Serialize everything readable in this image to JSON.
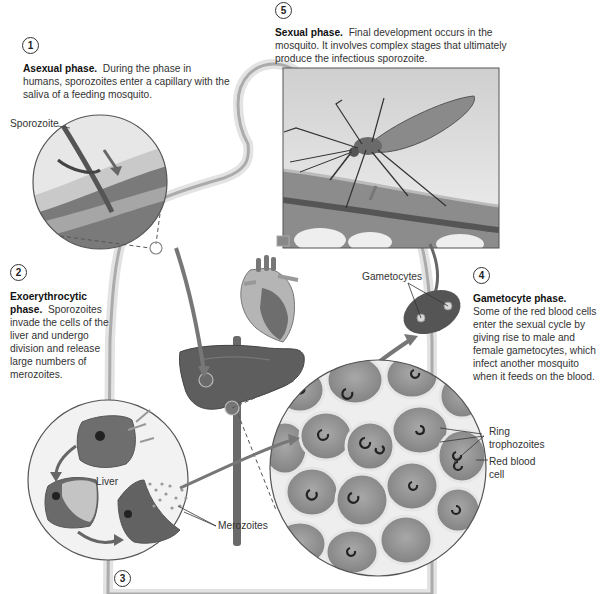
{
  "diagram": {
    "colors": {
      "background": "#ffffff",
      "silhouette_edge": "#6a6a6a",
      "tissue_dark": "#5c5c5c",
      "tissue_mid": "#8a8a8a",
      "cell_fill": "#9a9a9a",
      "cell_border": "#e8e8e8",
      "text": "#333333"
    }
  },
  "steps": [
    {
      "number": "1",
      "title": "Asexual phase.",
      "body": "During the phase in humans, sporozoites enter a capillary with the saliva of a feeding mosquito."
    },
    {
      "number": "2",
      "title": "Exoerythrocytic phase.",
      "body": "Sporozoites invade the cells of the liver and undergo division and release large numbers of merozoites."
    },
    {
      "number": "3",
      "title": "",
      "body": ""
    },
    {
      "number": "4",
      "title": "Gametocyte phase.",
      "body": "Some of the red blood cells enter the sexual cycle by giving rise to male and female gametocytes, which infect another mosquito when it feeds on the blood."
    },
    {
      "number": "5",
      "title": "Sexual phase.",
      "body": "Final development occurs in the mosquito. It involves complex stages that ultimately produce the infectious sporozoite."
    }
  ],
  "labels": {
    "sporozoite": "Sporozoite",
    "liver": "Liver",
    "merozoites": "Merozoites",
    "gametocytes": "Gametocytes",
    "ring_trophozoites_line1": "Ring",
    "ring_trophozoites_line2": "trophozoites",
    "red_blood_cell_line1": "Red blood",
    "red_blood_cell_line2": "cell"
  },
  "icons": {
    "human": "human-silhouette-icon",
    "heart": "heart-icon",
    "liver": "liver-icon",
    "mosquito": "mosquito-icon"
  }
}
